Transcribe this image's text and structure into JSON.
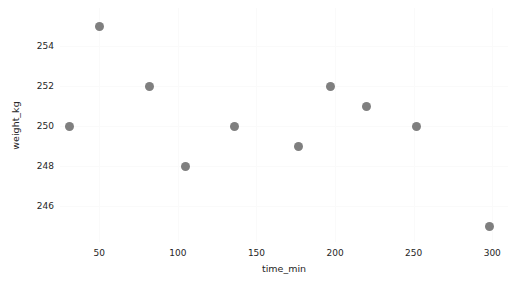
{
  "chart_data": {
    "type": "scatter",
    "title": "",
    "xlabel": "time_min",
    "ylabel": "weight_kg",
    "xlim": [
      25,
      310
    ],
    "ylim": [
      244.2,
      255.9
    ],
    "xticks": [
      50,
      100,
      150,
      200,
      250,
      300
    ],
    "xtick_labels": [
      "50",
      "100",
      "150",
      "200",
      "250",
      "300"
    ],
    "yticks": [
      246,
      248,
      250,
      252,
      254
    ],
    "ytick_labels": [
      "246",
      "248",
      "250",
      "252",
      "254"
    ],
    "grid": true,
    "legend": "none",
    "marker": {
      "shape": "circle",
      "color": "#7f7f7f",
      "size_px": 9
    },
    "series": [
      {
        "name": "weight_kg",
        "x": [
          31,
          50,
          82,
          105,
          136,
          177,
          197,
          220,
          252,
          298
        ],
        "y": [
          250,
          255,
          252,
          248,
          250,
          249,
          252,
          251,
          250,
          245
        ],
        "points": [
          {
            "time_min": 31,
            "weight_kg": 250
          },
          {
            "time_min": 50,
            "weight_kg": 255
          },
          {
            "time_min": 82,
            "weight_kg": 252
          },
          {
            "time_min": 105,
            "weight_kg": 248
          },
          {
            "time_min": 136,
            "weight_kg": 250
          },
          {
            "time_min": 177,
            "weight_kg": 249
          },
          {
            "time_min": 197,
            "weight_kg": 252
          },
          {
            "time_min": 220,
            "weight_kg": 251
          },
          {
            "time_min": 252,
            "weight_kg": 250
          },
          {
            "time_min": 298,
            "weight_kg": 245
          }
        ]
      }
    ],
    "colors": {
      "background": "#ffffff",
      "plot_background": "#ffffff",
      "gridline": "#fafafa",
      "tick_text": "#262626",
      "marker": "#7f7f7f"
    }
  }
}
